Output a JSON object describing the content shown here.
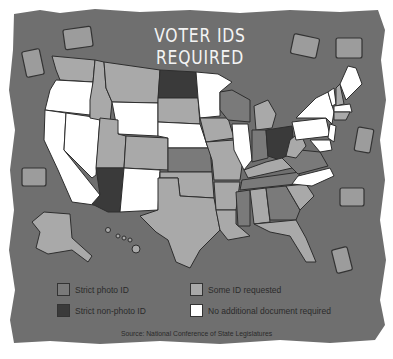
{
  "title": "VOTER IDS REQUIRED",
  "legend": [
    {
      "key": "strict_photo",
      "label": "Strict photo ID",
      "color": "#7a7a7a"
    },
    {
      "key": "some_id",
      "label": "Some ID requested",
      "color": "#a9a9a9"
    },
    {
      "key": "strict_nonphoto",
      "label": "Strict non-photo ID",
      "color": "#3a3a3a"
    },
    {
      "key": "none",
      "label": "No additional document required",
      "color": "#ffffff"
    }
  ],
  "source": "Source: National Conference of State Legislatures",
  "colors": {
    "background": "#6f6f6f",
    "border": "#2e2e2e"
  },
  "map_data": {
    "strict_photo": [
      "Kansas",
      "Wisconsin",
      "Indiana",
      "Tennessee",
      "Mississippi",
      "Georgia",
      "Virginia"
    ],
    "strict_nonphoto": [
      "Arizona",
      "North Dakota",
      "Ohio"
    ],
    "some_id": [
      "Washington",
      "Idaho",
      "Montana",
      "Utah",
      "Colorado",
      "South Dakota",
      "Texas",
      "Oklahoma",
      "Iowa",
      "Missouri",
      "Arkansas",
      "Louisiana",
      "Michigan",
      "Kentucky",
      "Alabama",
      "Florida",
      "South Carolina",
      "West Virginia",
      "Alaska",
      "Hawaii",
      "New Hampshire",
      "Rhode Island",
      "Connecticut"
    ],
    "none": [
      "Oregon",
      "California",
      "Nevada",
      "Wyoming",
      "New Mexico",
      "Nebraska",
      "Minnesota",
      "Illinois",
      "North Carolina",
      "Pennsylvania",
      "New York",
      "Vermont",
      "Maine",
      "Massachusetts",
      "New Jersey",
      "Maryland",
      "Delaware"
    ]
  }
}
